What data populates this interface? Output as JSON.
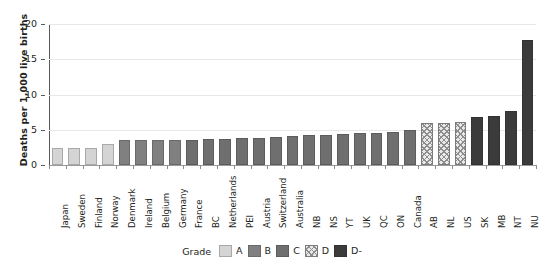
{
  "chart_data": {
    "type": "bar",
    "title": "",
    "xlabel": "",
    "ylabel": "Deaths per 1,000 live births",
    "ylim": [
      0,
      20
    ],
    "yticks": [
      0,
      5,
      10,
      15,
      20
    ],
    "grid": true,
    "legend_position": "bottom",
    "legend_title": "Grade",
    "categories": [
      "Japan",
      "Sweden",
      "Finland",
      "Norway",
      "Denmark",
      "Ireland",
      "Belgium",
      "Germany",
      "France",
      "BC",
      "Netherlands",
      "PEI",
      "Austria",
      "Switzerland",
      "Australia",
      "NB",
      "NS",
      "YT",
      "UK",
      "QC",
      "ON",
      "Canada",
      "AB",
      "NL",
      "US",
      "SK",
      "MB",
      "NT",
      "NU"
    ],
    "values": [
      2.4,
      2.4,
      2.4,
      3.0,
      3.5,
      3.5,
      3.5,
      3.5,
      3.6,
      3.7,
      3.7,
      3.8,
      3.9,
      4.0,
      4.1,
      4.2,
      4.3,
      4.4,
      4.5,
      4.6,
      4.7,
      4.9,
      5.9,
      5.9,
      6.1,
      6.8,
      7.0,
      7.6,
      17.8
    ],
    "grades": [
      "A",
      "A",
      "A",
      "A",
      "B",
      "B",
      "B",
      "B",
      "C",
      "C",
      "C",
      "C",
      "C",
      "C",
      "C",
      "C",
      "C",
      "C",
      "C",
      "C",
      "C",
      "C",
      "D",
      "D",
      "D",
      "D-",
      "D-",
      "D-",
      "D-"
    ],
    "legend": [
      {
        "label": "A",
        "grade": "A",
        "color": "#d4d4d4"
      },
      {
        "label": "B",
        "grade": "B",
        "color": "#808080"
      },
      {
        "label": "C",
        "grade": "C",
        "color": "#6f6f6f"
      },
      {
        "label": "D",
        "grade": "D",
        "color": "#b4b4b4"
      },
      {
        "label": "D-",
        "grade": "D-",
        "color": "#3b3b3b"
      }
    ]
  }
}
